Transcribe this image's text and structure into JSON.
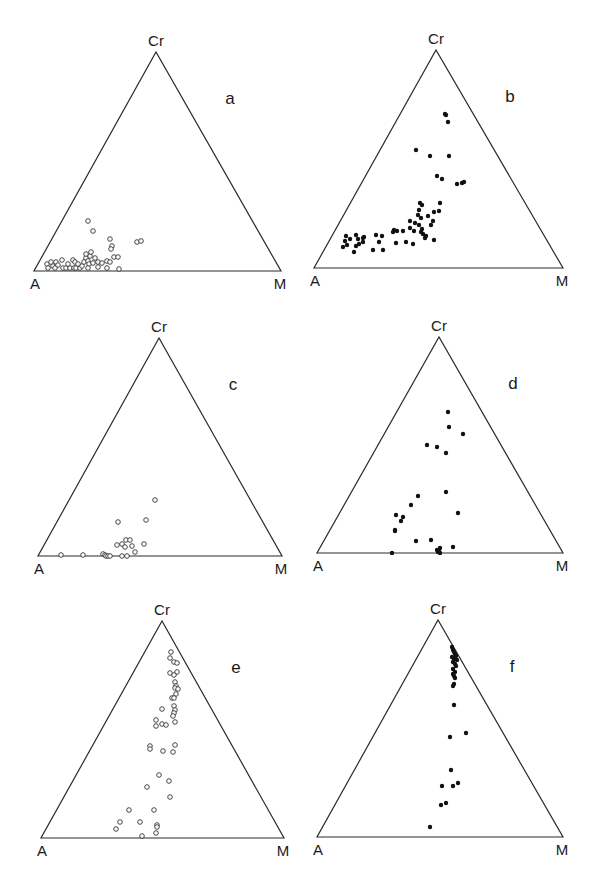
{
  "chart_data": [
    {
      "type": "scatter",
      "panel": "a",
      "title": "a",
      "plot": "ternary",
      "vertices": {
        "top": "Cr",
        "left": "A",
        "right": "M"
      },
      "marker": "open-circle",
      "geometry": {
        "A": [
          34,
          271
        ],
        "M": [
          281,
          271
        ],
        "Cr": [
          156,
          52
        ]
      },
      "points_px": [
        [
          47,
          264
        ],
        [
          53,
          266
        ],
        [
          51,
          262
        ],
        [
          56,
          262
        ],
        [
          48,
          268
        ],
        [
          55,
          268
        ],
        [
          58,
          265
        ],
        [
          62,
          260
        ],
        [
          63,
          268
        ],
        [
          66,
          268
        ],
        [
          70,
          268
        ],
        [
          74,
          268
        ],
        [
          68,
          264
        ],
        [
          73,
          260
        ],
        [
          75,
          262
        ],
        [
          76,
          268
        ],
        [
          80,
          268
        ],
        [
          82,
          266
        ],
        [
          78,
          264
        ],
        [
          86,
          258
        ],
        [
          84,
          262
        ],
        [
          88,
          261
        ],
        [
          89,
          264
        ],
        [
          88,
          268
        ],
        [
          90,
          256
        ],
        [
          86,
          254
        ],
        [
          91,
          252
        ],
        [
          93,
          263
        ],
        [
          95,
          258
        ],
        [
          98,
          267
        ],
        [
          98,
          262
        ],
        [
          102,
          263
        ],
        [
          107,
          261
        ],
        [
          107,
          268
        ],
        [
          110,
          262
        ],
        [
          114,
          257
        ],
        [
          118,
          257
        ],
        [
          119,
          269
        ],
        [
          88,
          221
        ],
        [
          93,
          231
        ],
        [
          110,
          239
        ],
        [
          112,
          246
        ],
        [
          111,
          249
        ],
        [
          137,
          242
        ],
        [
          141,
          241
        ],
        [
          30,
          0
        ]
      ],
      "xlabel": "",
      "ylabel": ""
    },
    {
      "type": "scatter",
      "panel": "b",
      "title": "b",
      "plot": "ternary",
      "vertices": {
        "top": "Cr",
        "left": "A",
        "right": "M"
      },
      "marker": "filled-circle",
      "geometry": {
        "A": [
          314,
          268
        ],
        "M": [
          563,
          268
        ],
        "Cr": [
          436,
          50
        ]
      },
      "points_px": [
        [
          445,
          114
        ],
        [
          446,
          115
        ],
        [
          448,
          122
        ],
        [
          416,
          150
        ],
        [
          430,
          156
        ],
        [
          449,
          156
        ],
        [
          437,
          176
        ],
        [
          442,
          179
        ],
        [
          457,
          184
        ],
        [
          462,
          183
        ],
        [
          464,
          182
        ],
        [
          420,
          203
        ],
        [
          422,
          205
        ],
        [
          419,
          210
        ],
        [
          418,
          215
        ],
        [
          415,
          223
        ],
        [
          410,
          221
        ],
        [
          421,
          218
        ],
        [
          428,
          216
        ],
        [
          440,
          203
        ],
        [
          439,
          211
        ],
        [
          434,
          212
        ],
        [
          433,
          221
        ],
        [
          431,
          225
        ],
        [
          419,
          225
        ],
        [
          414,
          231
        ],
        [
          403,
          231
        ],
        [
          396,
          243
        ],
        [
          394,
          230
        ],
        [
          410,
          228
        ],
        [
          422,
          229
        ],
        [
          426,
          236
        ],
        [
          421,
          232
        ],
        [
          423,
          234
        ],
        [
          425,
          238
        ],
        [
          434,
          240
        ],
        [
          413,
          244
        ],
        [
          406,
          242
        ],
        [
          397,
          231
        ],
        [
          393,
          232
        ],
        [
          376,
          235
        ],
        [
          382,
          236
        ],
        [
          383,
          250
        ],
        [
          364,
          237
        ],
        [
          379,
          242
        ],
        [
          363,
          238
        ],
        [
          373,
          250
        ],
        [
          356,
          235
        ],
        [
          350,
          239
        ],
        [
          354,
          252
        ],
        [
          358,
          239
        ],
        [
          347,
          245
        ],
        [
          343,
          247
        ],
        [
          345,
          241
        ],
        [
          356,
          246
        ],
        [
          363,
          242
        ],
        [
          359,
          244
        ],
        [
          346,
          236
        ]
      ],
      "xlabel": "",
      "ylabel": ""
    },
    {
      "type": "scatter",
      "panel": "c",
      "title": "c",
      "plot": "ternary",
      "vertices": {
        "top": "Cr",
        "left": "A",
        "right": "M"
      },
      "marker": "open-circle",
      "geometry": {
        "A": [
          38,
          556
        ],
        "M": [
          282,
          556
        ],
        "Cr": [
          159,
          338
        ]
      },
      "points_px": [
        [
          155,
          500
        ],
        [
          118,
          522
        ],
        [
          146,
          520
        ],
        [
          117,
          545
        ],
        [
          122,
          544
        ],
        [
          126,
          540
        ],
        [
          130,
          540
        ],
        [
          125,
          547
        ],
        [
          132,
          546
        ],
        [
          144,
          544
        ],
        [
          135,
          552
        ],
        [
          61,
          555
        ],
        [
          83,
          555
        ],
        [
          103,
          554
        ],
        [
          105,
          555
        ],
        [
          106,
          556
        ],
        [
          108,
          556
        ],
        [
          110,
          556
        ],
        [
          122,
          556
        ],
        [
          127,
          556
        ]
      ],
      "xlabel": "",
      "ylabel": ""
    },
    {
      "type": "scatter",
      "panel": "d",
      "title": "d",
      "plot": "ternary",
      "vertices": {
        "top": "Cr",
        "left": "A",
        "right": "M"
      },
      "marker": "filled-circle",
      "geometry": {
        "A": [
          317,
          553
        ],
        "M": [
          563,
          553
        ],
        "Cr": [
          439,
          337
        ]
      },
      "points_px": [
        [
          448,
          412
        ],
        [
          449,
          427
        ],
        [
          463,
          434
        ],
        [
          427,
          445
        ],
        [
          437,
          447
        ],
        [
          446,
          453
        ],
        [
          446,
          492
        ],
        [
          418,
          496
        ],
        [
          411,
          505
        ],
        [
          458,
          513
        ],
        [
          403,
          517
        ],
        [
          396,
          515
        ],
        [
          401,
          521
        ],
        [
          395,
          530
        ],
        [
          395,
          531
        ],
        [
          416,
          541
        ],
        [
          431,
          540
        ],
        [
          440,
          548
        ],
        [
          453,
          547
        ],
        [
          392,
          553
        ],
        [
          437,
          550
        ],
        [
          438,
          552
        ],
        [
          440,
          553
        ],
        [
          439,
          551
        ]
      ],
      "xlabel": "",
      "ylabel": ""
    },
    {
      "type": "scatter",
      "panel": "e",
      "title": "e",
      "plot": "ternary",
      "vertices": {
        "top": "Cr",
        "left": "A",
        "right": "M"
      },
      "marker": "open-circle",
      "geometry": {
        "A": [
          41,
          838
        ],
        "M": [
          284,
          838
        ],
        "Cr": [
          162,
          621
        ]
      },
      "points_px": [
        [
          171,
          652
        ],
        [
          170,
          658
        ],
        [
          174,
          662
        ],
        [
          177,
          663
        ],
        [
          170,
          673
        ],
        [
          177,
          672
        ],
        [
          174,
          675
        ],
        [
          175,
          682
        ],
        [
          176,
          686
        ],
        [
          175,
          688
        ],
        [
          178,
          689
        ],
        [
          176,
          694
        ],
        [
          172,
          698
        ],
        [
          174,
          698
        ],
        [
          174,
          706
        ],
        [
          175,
          710
        ],
        [
          174,
          713
        ],
        [
          173,
          716
        ],
        [
          162,
          709
        ],
        [
          156,
          720
        ],
        [
          156,
          726
        ],
        [
          162,
          724
        ],
        [
          166,
          725
        ],
        [
          175,
          722
        ],
        [
          150,
          746
        ],
        [
          150,
          749
        ],
        [
          163,
          751
        ],
        [
          175,
          745
        ],
        [
          173,
          752
        ],
        [
          159,
          775
        ],
        [
          169,
          781
        ],
        [
          147,
          787
        ],
        [
          170,
          797
        ],
        [
          129,
          810
        ],
        [
          154,
          810
        ],
        [
          120,
          822
        ],
        [
          140,
          822
        ],
        [
          157,
          825
        ],
        [
          157,
          827
        ],
        [
          116,
          829
        ],
        [
          156,
          833
        ],
        [
          142,
          836
        ]
      ],
      "xlabel": "",
      "ylabel": ""
    },
    {
      "type": "scatter",
      "panel": "f",
      "title": "f",
      "plot": "ternary",
      "vertices": {
        "top": "Cr",
        "left": "A",
        "right": "M"
      },
      "marker": "filled-circle",
      "geometry": {
        "A": [
          317,
          837
        ],
        "M": [
          563,
          837
        ],
        "Cr": [
          438,
          620
        ]
      },
      "points_px": [
        [
          452,
          647
        ],
        [
          453,
          650
        ],
        [
          454,
          652
        ],
        [
          455,
          654
        ],
        [
          456,
          656
        ],
        [
          452,
          657
        ],
        [
          454,
          659
        ],
        [
          457,
          660
        ],
        [
          453,
          662
        ],
        [
          455,
          664
        ],
        [
          456,
          666
        ],
        [
          453,
          669
        ],
        [
          455,
          672
        ],
        [
          454,
          676
        ],
        [
          455,
          678
        ],
        [
          453,
          674
        ],
        [
          454,
          684
        ],
        [
          453,
          686
        ],
        [
          454,
          705
        ],
        [
          450,
          737
        ],
        [
          451,
          770
        ],
        [
          466,
          733
        ],
        [
          453,
          786
        ],
        [
          458,
          783
        ],
        [
          442,
          786
        ],
        [
          441,
          805
        ],
        [
          446,
          803
        ],
        [
          430,
          827
        ]
      ],
      "xlabel": "",
      "ylabel": ""
    }
  ],
  "labels": {
    "top_vertex": "Cr",
    "left_vertex": "A",
    "right_vertex": "M",
    "panels": [
      "a",
      "b",
      "c",
      "d",
      "e",
      "f"
    ]
  }
}
